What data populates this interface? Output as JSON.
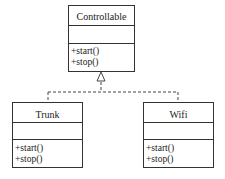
{
  "diagram": {
    "type": "uml-class",
    "relation": "realization",
    "interface": {
      "name": "Controllable",
      "attributes": [],
      "operations": [
        "+start()",
        "+stop()"
      ]
    },
    "classes": [
      {
        "name": "Trunk",
        "attributes": [],
        "operations": [
          "+start()",
          "+stop()"
        ]
      },
      {
        "name": "Wifi",
        "attributes": [],
        "operations": [
          "+start()",
          "+stop()"
        ]
      }
    ],
    "colors": {
      "line": "#333333",
      "background": "#ffffff"
    }
  }
}
